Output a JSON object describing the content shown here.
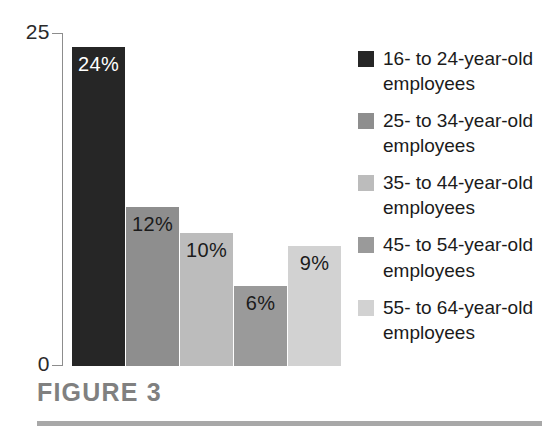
{
  "caption": {
    "text": "FIGURE 3"
  },
  "colors": {
    "axis": "#8d8d8d",
    "text": "#1b1b1b",
    "caption": "#808080",
    "rule": "#a8a8a8",
    "background": "#ffffff"
  },
  "chart_data": {
    "type": "bar",
    "title": "FIGURE 3",
    "xlabel": "",
    "ylabel": "",
    "ylim": [
      0,
      25
    ],
    "yticks": [
      0,
      25
    ],
    "ytick_labels": [
      "0",
      "25"
    ],
    "grid": false,
    "legend_position": "right",
    "categories": [
      "16- to 24-year-old employees",
      "25- to 34-year-old employees",
      "35- to 44-year-old employees",
      "45- to 54-year-old employees",
      "55- to 64-year-old employees"
    ],
    "values": [
      24,
      12,
      10,
      6,
      9
    ],
    "data_labels": [
      "24%",
      "12%",
      "10%",
      "6%",
      "9%"
    ],
    "bar_colors": [
      "#262626",
      "#8e8e8e",
      "#bcbcbc",
      "#9a9a9a",
      "#d2d2d2"
    ],
    "label_colors": [
      "#ffffff",
      "#1b1b1b",
      "#1b1b1b",
      "#1b1b1b",
      "#1b1b1b"
    ]
  },
  "legend": {
    "items": [
      {
        "label": "16- to 24-year-old employees",
        "color": "#262626"
      },
      {
        "label": "25- to 34-year-old employees",
        "color": "#8e8e8e"
      },
      {
        "label": "35- to 44-year-old employees",
        "color": "#bcbcbc"
      },
      {
        "label": "45- to 54-year-old employees",
        "color": "#9a9a9a"
      },
      {
        "label": "55- to 64-year-old employees",
        "color": "#d2d2d2"
      }
    ]
  }
}
